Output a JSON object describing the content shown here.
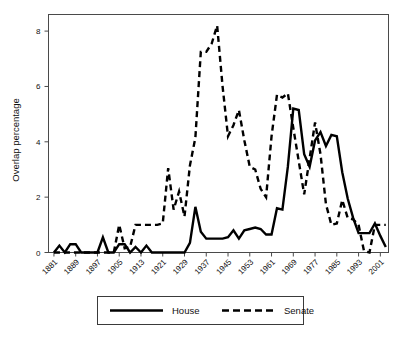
{
  "chart_data": {
    "type": "line",
    "title": "",
    "subtitle": "",
    "xlabel": "",
    "ylabel": "Overlap percentage",
    "xlim": [
      1879,
      2004
    ],
    "ylim": [
      0,
      8.6
    ],
    "grid": false,
    "legend_position": "bottom-outside",
    "y_ticks": [
      "0",
      "2",
      "4",
      "6",
      "8"
    ],
    "y_tick_values": [
      0,
      2,
      4,
      6,
      8
    ],
    "x_ticks": [
      "1881",
      "1889",
      "1897",
      "1905",
      "1913",
      "1921",
      "1929",
      "1937",
      "1945",
      "1953",
      "1961",
      "1969",
      "1977",
      "1985",
      "1993",
      "2001"
    ],
    "x_tick_values": [
      1881,
      1889,
      1897,
      1905,
      1913,
      1921,
      1929,
      1937,
      1945,
      1953,
      1961,
      1969,
      1977,
      1985,
      1993,
      2001
    ],
    "x": [
      1881,
      1883,
      1885,
      1887,
      1889,
      1891,
      1893,
      1895,
      1897,
      1899,
      1901,
      1903,
      1905,
      1907,
      1909,
      1911,
      1913,
      1915,
      1917,
      1919,
      1921,
      1923,
      1925,
      1927,
      1929,
      1931,
      1933,
      1935,
      1937,
      1939,
      1941,
      1943,
      1945,
      1947,
      1949,
      1951,
      1953,
      1955,
      1957,
      1959,
      1961,
      1963,
      1965,
      1967,
      1969,
      1971,
      1973,
      1975,
      1977,
      1979,
      1981,
      1983,
      1985,
      1987,
      1989,
      1991,
      1993,
      1995,
      1997,
      1999,
      2001,
      2003
    ],
    "series": [
      {
        "name": "House",
        "style": "solid",
        "color": "#000000",
        "values": [
          0.0,
          0.25,
          0.0,
          0.3,
          0.3,
          0.0,
          0.0,
          0.0,
          0.0,
          0.55,
          0.0,
          0.0,
          0.3,
          0.3,
          0.0,
          0.2,
          0.0,
          0.25,
          0.0,
          0.0,
          0.0,
          0.0,
          0.0,
          0.0,
          0.0,
          0.35,
          1.65,
          0.75,
          0.5,
          0.5,
          0.5,
          0.5,
          0.55,
          0.8,
          0.5,
          0.8,
          0.85,
          0.9,
          0.85,
          0.65,
          0.65,
          1.6,
          1.55,
          3.1,
          5.2,
          5.15,
          3.55,
          3.1,
          4.05,
          4.35,
          3.85,
          4.25,
          4.2,
          2.9,
          1.95,
          1.25,
          0.7,
          0.7,
          0.7,
          1.05,
          0.6,
          0.2
        ]
      },
      {
        "name": "Senate",
        "style": "dashed",
        "color": "#000000",
        "values": [
          0.0,
          0.0,
          0.0,
          0.0,
          0.0,
          0.0,
          0.0,
          0.0,
          0.0,
          0.0,
          0.0,
          0.0,
          1.0,
          0.15,
          0.2,
          1.0,
          1.0,
          1.0,
          1.0,
          1.0,
          1.05,
          3.05,
          1.55,
          2.2,
          1.3,
          3.15,
          4.15,
          7.25,
          7.25,
          7.55,
          8.2,
          6.0,
          4.2,
          4.6,
          5.15,
          4.05,
          3.1,
          3.0,
          2.3,
          2.0,
          4.2,
          5.7,
          5.6,
          5.75,
          4.5,
          3.3,
          2.1,
          3.4,
          4.7,
          3.55,
          1.75,
          1.0,
          1.05,
          1.9,
          1.25,
          1.2,
          1.0,
          0.05,
          0.0,
          1.0,
          1.0,
          1.0
        ]
      }
    ]
  },
  "legend": {
    "entries": [
      {
        "label": "House",
        "style": "solid"
      },
      {
        "label": "Senate",
        "style": "dashed"
      }
    ]
  }
}
